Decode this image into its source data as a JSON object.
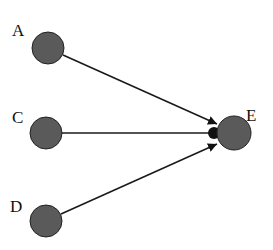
{
  "diagram": {
    "nodes": [
      {
        "id": "A",
        "label": "A",
        "x": 48,
        "y": 48,
        "r": 16,
        "lx": 12,
        "ly": 36
      },
      {
        "id": "C",
        "label": "C",
        "x": 46,
        "y": 133,
        "r": 16,
        "lx": 12,
        "ly": 122
      },
      {
        "id": "D",
        "label": "D",
        "x": 46,
        "y": 221,
        "r": 16,
        "lx": 10,
        "ly": 211
      },
      {
        "id": "E",
        "label": "E",
        "x": 234,
        "y": 133,
        "r": 17,
        "lx": 246,
        "ly": 120
      }
    ],
    "edges": [
      {
        "from": "A",
        "to": "E",
        "head": "arrow"
      },
      {
        "from": "C",
        "to": "E",
        "head": "dot"
      },
      {
        "from": "D",
        "to": "E",
        "head": "arrow"
      }
    ],
    "colors": {
      "node_fill": "#5a5a5a",
      "edge": "#1a1a1a",
      "label": "#111111"
    }
  }
}
